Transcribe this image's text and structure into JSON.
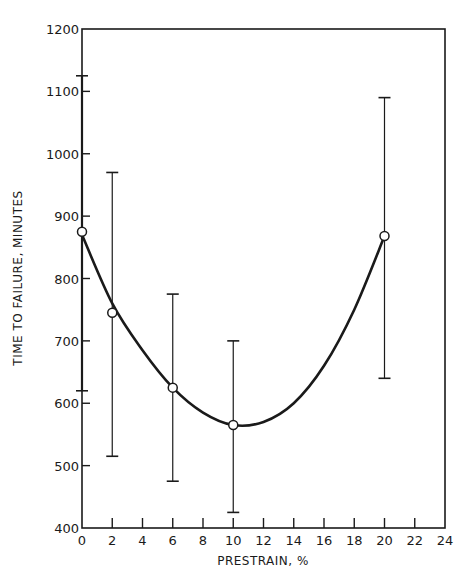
{
  "chart_data": {
    "type": "line",
    "title": "",
    "xlabel": "PRESTRAIN, %",
    "ylabel": "TIME TO FAILURE, MINUTES",
    "xlim": [
      0,
      24
    ],
    "ylim": [
      400,
      1200
    ],
    "x_ticks": [
      0,
      2,
      4,
      6,
      8,
      10,
      12,
      14,
      16,
      18,
      20,
      22,
      24
    ],
    "y_ticks": [
      400,
      500,
      600,
      700,
      800,
      900,
      1000,
      1100,
      1200
    ],
    "grid": false,
    "legend": null,
    "series": [
      {
        "name": "Mean time to failure",
        "marker": "open-circle",
        "x": [
          0,
          2,
          6,
          10,
          20
        ],
        "values": [
          875,
          745,
          625,
          565,
          868
        ],
        "error_high": [
          1125,
          970,
          775,
          700,
          1090
        ],
        "error_low": [
          620,
          515,
          475,
          425,
          640
        ]
      },
      {
        "name": "Fitted curve",
        "marker": "none",
        "x": [
          0,
          2,
          4,
          6,
          8,
          10,
          12,
          14,
          16,
          18,
          20
        ],
        "values": [
          870,
          760,
          685,
          625,
          585,
          565,
          570,
          600,
          660,
          750,
          868
        ]
      }
    ]
  }
}
